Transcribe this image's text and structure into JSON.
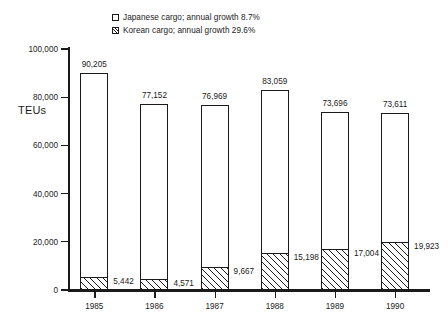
{
  "chart_data": {
    "type": "bar",
    "title": "",
    "subtitle": "",
    "xlabel": "",
    "ylabel": "TEUs",
    "ylim": [
      0,
      100000
    ],
    "ytick_values": [
      0,
      20000,
      40000,
      60000,
      80000,
      100000
    ],
    "ytick_labels": [
      "0",
      "20,000",
      "40,000",
      "60,000",
      "80,000",
      "100,000"
    ],
    "grid": false,
    "legend_position": "top-center",
    "categories": [
      "1985",
      "1986",
      "1987",
      "1988",
      "1989",
      "1990"
    ],
    "series": [
      {
        "name": "Japanese cargo; annual growth 8.7%",
        "short_name": "Japanese cargo",
        "annual_growth": "8.7%",
        "style": "open",
        "values": [
          90205,
          77152,
          76969,
          83059,
          73696,
          73611
        ],
        "labels": [
          "90,205",
          "77,152",
          "76,969",
          "83,059",
          "73,696",
          "73,611"
        ]
      },
      {
        "name": "Korean cargo; annual growth 29.6%",
        "short_name": "Korean cargo",
        "annual_growth": "29.6%",
        "style": "hatched",
        "values": [
          5442,
          4571,
          9667,
          15198,
          17004,
          19923
        ],
        "labels": [
          "5,442",
          "4,571",
          "9,667",
          "15,198",
          "17,004",
          "19,923"
        ]
      }
    ]
  },
  "legend": {
    "items": [
      {
        "label": "Japanese cargo; annual growth 8.7%",
        "swatch": "open-square-icon"
      },
      {
        "label": "Korean cargo; annual growth 29.6%",
        "swatch": "hatched-square-icon"
      }
    ]
  },
  "axes": {
    "y_title": "TEUs"
  }
}
